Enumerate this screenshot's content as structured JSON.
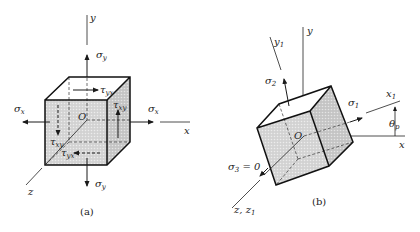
{
  "figure": {
    "panels": [
      {
        "id": "a",
        "caption": "(a)",
        "labels": {
          "y_axis": "y",
          "x_axis": "x",
          "z_axis": "z",
          "origin": "O",
          "sigma_y_top": "σ",
          "sigma_y_top_sub": "y",
          "sigma_y_bottom": "σ",
          "sigma_y_bottom_sub": "y",
          "sigma_x_left": "σ",
          "sigma_x_left_sub": "x",
          "sigma_x_right": "σ",
          "sigma_x_right_sub": "x",
          "tau_yx_top": "τ",
          "tau_yx_top_sub": "yx",
          "tau_xy_right": "τ",
          "tau_xy_right_sub": "xy",
          "tau_xy_left": "τ",
          "tau_xy_left_sub": "xy",
          "tau_yx_bottom": "τ",
          "tau_yx_bottom_sub": "yx"
        }
      },
      {
        "id": "b",
        "caption": "(b)",
        "labels": {
          "y_axis": "y",
          "y1_axis": "y",
          "y1_axis_sub": "1",
          "x_axis": "x",
          "x1_axis": "x",
          "x1_axis_sub": "1",
          "z_axis": "z, z",
          "z_axis_sub": "1",
          "origin": "O",
          "sigma_1": "σ",
          "sigma_1_sub": "1",
          "sigma_2": "σ",
          "sigma_2_sub": "2",
          "sigma_3": "σ",
          "sigma_3_sub": "3",
          "sigma_3_eq": " = 0",
          "theta_p": "θ",
          "theta_p_sub": "p"
        }
      }
    ],
    "colors": {
      "line": "#1a1a1a",
      "face_shade": "#c9c9c9",
      "face_shade_dark": "#b8b8b8"
    }
  }
}
